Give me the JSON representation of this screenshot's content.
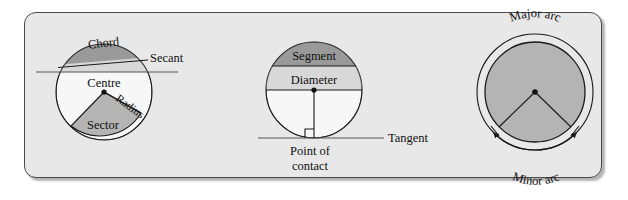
{
  "panel": {
    "background_color": "#e8e8e8",
    "border_color": "#4a4a4a"
  },
  "colors": {
    "dark_fill": "#9a9a9a",
    "light_fill": "#d8d8d8",
    "mid_fill": "#b4b4b4",
    "stroke": "#1a1a1a",
    "white_fill": "#f7f7f7"
  },
  "diagram": {
    "figures": [
      {
        "id": "circle-chord-sector",
        "labels": {
          "chord": "Chord",
          "secant": "Secant",
          "centre": "Centre",
          "radius": "Radius",
          "sector": "Sector"
        }
      },
      {
        "id": "circle-segment-tangent",
        "labels": {
          "segment": "Segment",
          "diameter": "Diameter",
          "tangent": "Tangent",
          "point_of_contact_line1": "Point of",
          "point_of_contact_line2": "contact"
        }
      },
      {
        "id": "circle-arcs",
        "labels": {
          "major_arc": "Major arc",
          "minor_arc": "Minor arc"
        }
      }
    ]
  }
}
